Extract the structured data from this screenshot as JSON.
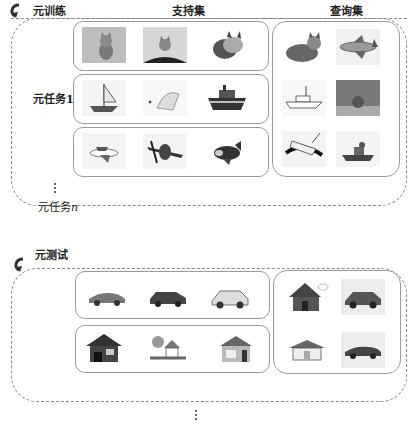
{
  "meta_train": {
    "title": "元训练",
    "support_header": "支持集",
    "query_header": "查询集",
    "task_label": "元任务1",
    "task_n_label": "元任务",
    "task_n_suffix": "n",
    "support_rows": [
      [
        "cat-icon",
        "cat-icon",
        "cat-icon"
      ],
      [
        "boat-icon",
        "boat-icon",
        "boat-icon"
      ],
      [
        "airplane-icon",
        "airplane-icon",
        "airplane-icon"
      ]
    ],
    "query_grid": [
      [
        "cat-icon",
        "airplane-icon"
      ],
      [
        "boat-icon",
        "cat-icon"
      ],
      [
        "airplane-icon",
        "boat-icon"
      ]
    ]
  },
  "meta_test": {
    "title": "元测试",
    "support_rows": [
      [
        "car-icon",
        "car-icon",
        "car-icon"
      ],
      [
        "house-icon",
        "house-icon",
        "house-icon"
      ]
    ],
    "query_grid": [
      [
        "house-icon",
        "car-icon"
      ],
      [
        "house-icon",
        "car-icon"
      ]
    ]
  },
  "colors": {
    "border_dashed": "#8a8a8a",
    "border_solid": "#9a9a9a",
    "thumb_bg": "#f2f2f2",
    "text": "#222222"
  }
}
